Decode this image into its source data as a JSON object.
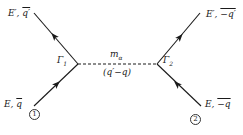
{
  "diagram": {
    "type": "feynman-diagram",
    "vertices": [
      {
        "id": "v1",
        "label": "Γ1",
        "x": 78,
        "y": 64
      },
      {
        "id": "v2",
        "label": "Γ2",
        "x": 157,
        "y": 64
      }
    ],
    "propagator": {
      "style": "dashed",
      "mass_label": "m_α",
      "mass_text": "m",
      "mass_sub": "α",
      "momentum_label": "(q′−q)"
    },
    "legs": [
      {
        "id": "in1",
        "label": "E, q⃗",
        "E": "E,",
        "q": "q",
        "particle": "1",
        "direction": "incoming"
      },
      {
        "id": "in2",
        "label": "E, −q⃗",
        "E": "E,",
        "q": "−q",
        "particle": "2",
        "direction": "incoming"
      },
      {
        "id": "out1",
        "label": "E′, q⃗′",
        "E": "E′,",
        "q": "q′",
        "direction": "outgoing"
      },
      {
        "id": "out2",
        "label": "E′, −q⃗′",
        "E": "E′,",
        "q": "−q′",
        "direction": "outgoing"
      }
    ],
    "particle_markers": [
      "①",
      "②"
    ],
    "vertex_labels": {
      "left": "Γ",
      "left_sub": "1",
      "right": "Γ",
      "right_sub": "2"
    },
    "colors": {
      "line": "#1a1a1a",
      "background": "#ffffff"
    }
  }
}
